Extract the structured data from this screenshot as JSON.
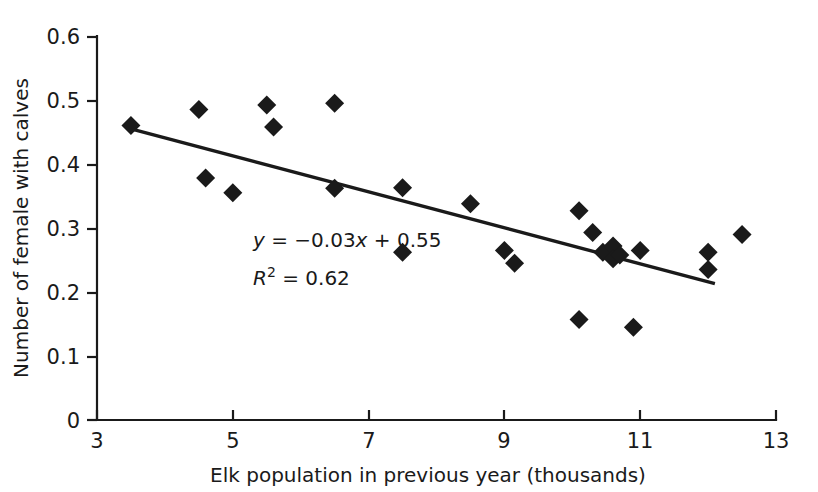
{
  "chart_data": {
    "type": "scatter",
    "title": "",
    "xlabel": "Elk population in previous year (thousands)",
    "ylabel": "Number of female with calves",
    "xlim": [
      3,
      13
    ],
    "ylim": [
      0,
      0.6
    ],
    "xticks": [
      "3",
      "5",
      "7",
      "9",
      "11",
      "13"
    ],
    "xtick_values": [
      3,
      5,
      7,
      9,
      11,
      13
    ],
    "yticks": [
      "0",
      "0.1",
      "0.2",
      "0.3",
      "0.4",
      "0.5",
      "0.6"
    ],
    "ytick_values": [
      0,
      0.1,
      0.2,
      0.3,
      0.4,
      0.5,
      0.6
    ],
    "grid": false,
    "legend": "none",
    "marker_shape": "diamond",
    "marker_color": "#1a1a1a",
    "series": [
      {
        "name": "Number of female with calves",
        "points": [
          [
            3.5,
            0.46
          ],
          [
            4.5,
            0.485
          ],
          [
            4.6,
            0.378
          ],
          [
            5.0,
            0.355
          ],
          [
            5.5,
            0.492
          ],
          [
            5.6,
            0.458
          ],
          [
            6.5,
            0.495
          ],
          [
            6.5,
            0.362
          ],
          [
            7.5,
            0.262
          ],
          [
            7.5,
            0.363
          ],
          [
            8.5,
            0.338
          ],
          [
            9.0,
            0.265
          ],
          [
            9.15,
            0.245
          ],
          [
            10.1,
            0.327
          ],
          [
            10.1,
            0.157
          ],
          [
            10.3,
            0.293
          ],
          [
            10.45,
            0.262
          ],
          [
            10.6,
            0.272
          ],
          [
            10.6,
            0.252
          ],
          [
            10.7,
            0.258
          ],
          [
            10.9,
            0.145
          ],
          [
            11.0,
            0.265
          ],
          [
            12.0,
            0.262
          ],
          [
            12.0,
            0.235
          ],
          [
            12.5,
            0.29
          ]
        ]
      }
    ],
    "trendline": {
      "equation_label": "y = −0.03x + 0.55",
      "r2_label": "R² = 0.62",
      "slope": -0.03,
      "intercept": 0.55,
      "r_squared": 0.62,
      "x_start": 3.5,
      "x_end": 12.1,
      "y_start": 0.455,
      "y_end": 0.213
    },
    "annotations": {
      "equation": {
        "prefix": "y",
        "body": " = −0.03",
        "var": "x",
        "suffix": " + 0.55"
      },
      "r_squared": {
        "prefix": "R",
        "sup": "2",
        "suffix": " = 0.62"
      }
    }
  }
}
